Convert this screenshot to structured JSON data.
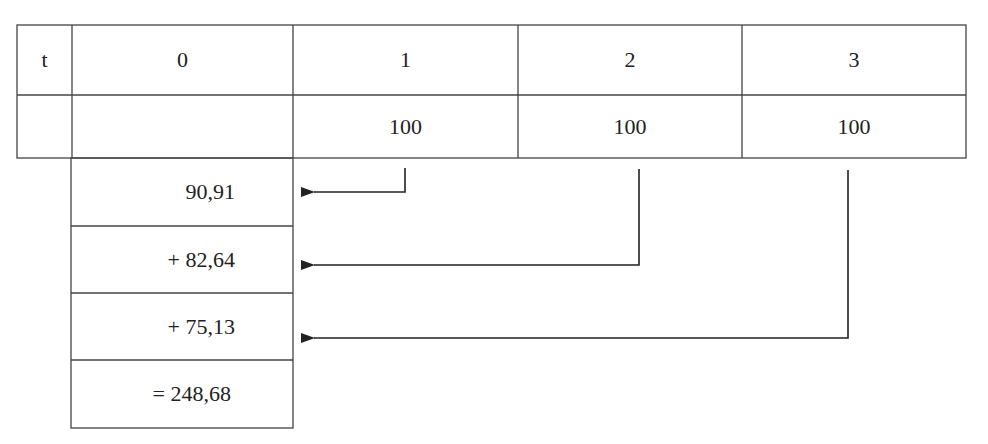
{
  "table": {
    "header": [
      "t",
      "0",
      "1",
      "2",
      "3"
    ],
    "cash_flows": [
      "",
      "",
      "100",
      "100",
      "100"
    ]
  },
  "present_values": {
    "items": [
      "90,91",
      "+ 82,64",
      "+ 75,13"
    ],
    "total": "= 248,68"
  },
  "arrows": [
    {
      "from_period": "1",
      "to_row": 0
    },
    {
      "from_period": "2",
      "to_row": 1
    },
    {
      "from_period": "3",
      "to_row": 2
    }
  ],
  "colors": {
    "line": "#333333",
    "text": "#222222",
    "background": "#ffffff"
  }
}
